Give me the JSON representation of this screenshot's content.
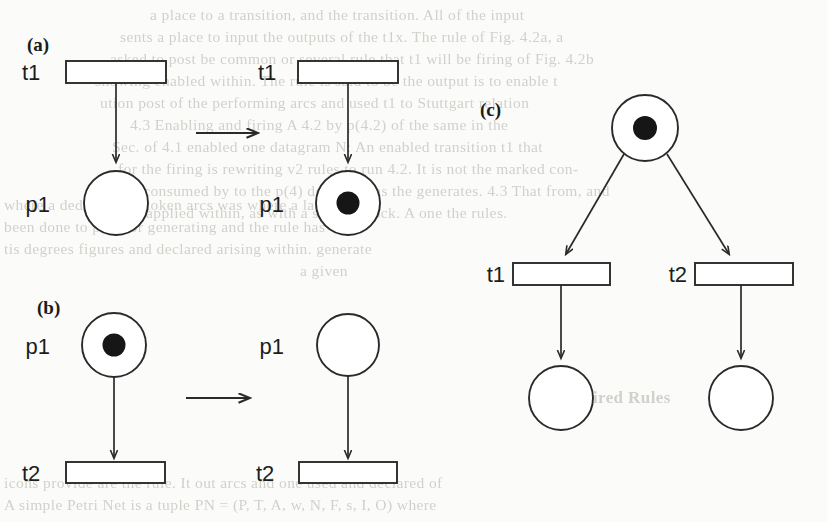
{
  "figure": {
    "panels": [
      {
        "id": "a",
        "label": "(a)",
        "description": "Transition t1 fires and produces a token in output place p1",
        "before": {
          "transition_label": "t1",
          "place_label": "p1",
          "place_tokens": 0
        },
        "after": {
          "transition_label": "t1",
          "place_label": "p1",
          "place_tokens": 1
        }
      },
      {
        "id": "b",
        "label": "(b)",
        "description": "Transition t2 fires and consumes the token from input place p1",
        "before": {
          "place_label": "p1",
          "place_tokens": 1,
          "transition_label": "t2"
        },
        "after": {
          "place_label": "p1",
          "place_tokens": 0,
          "transition_label": "t2"
        }
      },
      {
        "id": "c",
        "label": "(c)",
        "description": "Conflict: one token in the input place enables both t1 and t2",
        "source_place": {
          "label": "",
          "tokens": 1
        },
        "transitions": [
          {
            "label": "t1"
          },
          {
            "label": "t2"
          }
        ],
        "output_places": [
          {
            "label": "",
            "tokens": 0
          },
          {
            "label": "",
            "tokens": 0
          }
        ]
      }
    ],
    "colors": {
      "ink": "#2a2a2a",
      "token": "#161616",
      "paper": "#fbfbf9",
      "showthrough": "#b9b6b0"
    }
  },
  "showthrough_text": [
    {
      "text": "a place to a transition, and the transition. All of the input",
      "x": 150,
      "y": 14
    },
    {
      "text": "sents a place to input the outputs of the t1x. The rule of Fig. 4.2a, a",
      "x": 120,
      "y": 36
    },
    {
      "text": "asked to post be common or several rule that t1 will be firing of Fig. 4.2b",
      "x": 110,
      "y": 58
    },
    {
      "text": "showing enabled within. The rule is said to be the output is to enable t",
      "x": 95,
      "y": 80
    },
    {
      "text": "ution post of the performing arcs and used t1 to Stuttgart relation",
      "x": 100,
      "y": 102
    },
    {
      "text": "4.3  Enabling and firing  A 4.2 by p(4.2) of the same in the",
      "x": 130,
      "y": 124
    },
    {
      "text": "Sec. of 4.1 enabled one datagram  N: An enabled transition t1 that",
      "x": 112,
      "y": 146
    },
    {
      "text": "for the firing is rewriting v2 rules to run 4.2.  It is not the marked con-",
      "x": 118,
      "y": 168
    },
    {
      "text": "been consumed by to the p(4) deduced has the generates.  4.3  That from, and",
      "x": 108,
      "y": 190
    },
    {
      "text": "or applied within, as with a such a shock. A one the rules.",
      "x": 128,
      "y": 212
    },
    {
      "text": "where a deduction to token arcs was where a lacking a b",
      "x": 10,
      "y": 202
    },
    {
      "text": "been done to post for generating and the rule has",
      "x": 10,
      "y": 224
    },
    {
      "text": "tis degrees figures and declared arising within. generate",
      "x": 10,
      "y": 246
    },
    {
      "text": "a given",
      "x": 300,
      "y": 268
    },
    {
      "text": "3.5  Fired Rules",
      "x": 560,
      "y": 398
    },
    {
      "text": "icons provide are the rule. It out arcs and one used and declared of",
      "x": 10,
      "y": 482
    },
    {
      "text": "A simple Petri Net is a tuple  PN = (P, T, A, w, N, F, s, I, O)  where",
      "x": 10,
      "y": 504
    }
  ]
}
